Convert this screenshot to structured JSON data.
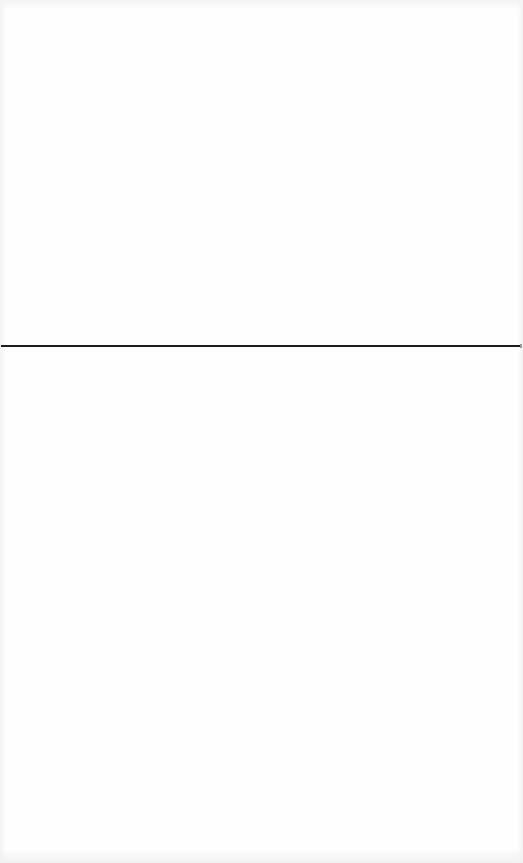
{
  "document": {
    "background_color": "#ffffff",
    "divider": {
      "orientation": "horizontal",
      "color": "#1c1c1c",
      "y": 346,
      "thickness": 2
    },
    "upper_section": {},
    "lower_section": {}
  }
}
